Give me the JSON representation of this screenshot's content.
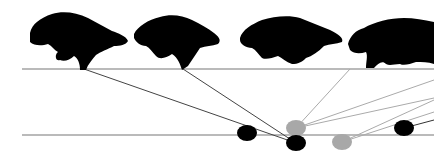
{
  "figure": {
    "frames": [
      {
        "id": 1,
        "x": 28
      },
      {
        "id": 2,
        "x": 133
      },
      {
        "id": 3,
        "x": 240
      },
      {
        "id": 4,
        "x": 345
      }
    ],
    "colors": {
      "silhouette": "#000000",
      "line_dark": "#555555",
      "line_light": "#aaaaaa",
      "foot_black": "#000000",
      "foot_grey": "#a8a8a8"
    },
    "footfalls": [
      {
        "x": 247,
        "y": 133,
        "color": "black"
      },
      {
        "x": 296,
        "y": 128,
        "color": "grey"
      },
      {
        "x": 296,
        "y": 143,
        "color": "black"
      },
      {
        "x": 342,
        "y": 142,
        "color": "grey"
      },
      {
        "x": 404,
        "y": 128,
        "color": "black"
      }
    ]
  }
}
